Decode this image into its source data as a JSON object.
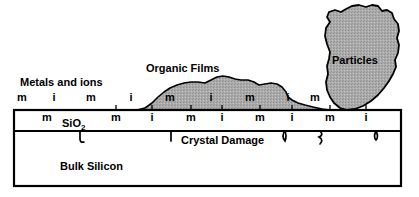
{
  "diagram": {
    "title_labels": {
      "metals_and_ions": "Metals and ions",
      "organic_films": "Organic Films",
      "particles": "Particles",
      "sio2": "SiO",
      "sio2_subscript": "2",
      "crystal_damage": "Crystal Damage",
      "bulk_silicon": "Bulk Silicon"
    },
    "colors": {
      "outline": "#000000",
      "fill_gray": "#a8a8a8",
      "background": "#ffffff"
    },
    "contaminant_rows": {
      "surface_row": {
        "description": "contaminant species resting on the surface / in organic film",
        "items": [
          {
            "label": "m",
            "x": 22,
            "y": 101
          },
          {
            "label": "i",
            "x": 54,
            "y": 101
          },
          {
            "label": "m",
            "x": 91,
            "y": 101
          },
          {
            "label": "i",
            "x": 131,
            "y": 101
          },
          {
            "label": "m",
            "x": 170,
            "y": 101
          },
          {
            "label": "i",
            "x": 211,
            "y": 101
          },
          {
            "label": "m",
            "x": 250,
            "y": 101
          },
          {
            "label": "i",
            "x": 288,
            "y": 101
          },
          {
            "label": "m",
            "x": 315,
            "y": 101
          }
        ]
      },
      "oxide_row": {
        "description": "contaminant species inside the SiO2 layer",
        "items": [
          {
            "label": "m",
            "x": 47,
            "y": 121
          },
          {
            "label": "m",
            "x": 116,
            "y": 121
          },
          {
            "label": "i",
            "x": 152,
            "y": 121
          },
          {
            "label": "m",
            "x": 191,
            "y": 121
          },
          {
            "label": "i",
            "x": 222,
            "y": 121
          },
          {
            "label": "m",
            "x": 260,
            "y": 121
          },
          {
            "label": "i",
            "x": 292,
            "y": 121
          },
          {
            "label": "m",
            "x": 330,
            "y": 121
          },
          {
            "label": "i",
            "x": 366,
            "y": 121
          }
        ]
      }
    },
    "crystal_defects": {
      "description": "squiggle marks hanging below the SiO2 / bulk silicon interface",
      "count": 5
    },
    "layers": [
      {
        "name": "SiO2",
        "top": 110,
        "bottom": 131
      },
      {
        "name": "Bulk Silicon",
        "top": 131,
        "bottom": 186
      }
    ]
  }
}
